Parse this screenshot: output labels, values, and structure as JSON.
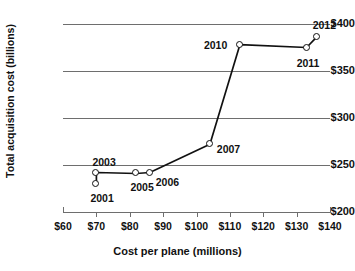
{
  "faint_header": {
    "text": ""
  },
  "chart_data": {
    "type": "line",
    "title": "",
    "xlabel": "Cost per plane (millions)",
    "ylabel": "Total acquisition cost (billions)",
    "xlim": [
      60,
      140
    ],
    "ylim": [
      200,
      400
    ],
    "grid": true,
    "legend": "none",
    "x_ticks": [
      "$60",
      "$70",
      "$80",
      "$90",
      "$100",
      "$110",
      "$120",
      "$130",
      "$140"
    ],
    "x_tick_values": [
      60,
      70,
      80,
      90,
      100,
      110,
      120,
      130,
      140
    ],
    "y_ticks": [
      "$200",
      "$250",
      "$300",
      "$350",
      "$400"
    ],
    "y_tick_values": [
      200,
      250,
      300,
      350,
      400
    ],
    "series": [
      {
        "name": "F-35 program",
        "points": [
          {
            "label": "2001",
            "x": 70,
            "y": 230,
            "label_dx": -6,
            "label_dy": 14
          },
          {
            "label": "2003",
            "x": 70,
            "y": 242,
            "label_dx": -4,
            "label_dy": -11
          },
          {
            "label": "2005",
            "x": 82,
            "y": 241,
            "label_dx": -6,
            "label_dy": 14
          },
          {
            "label": "2006",
            "x": 86,
            "y": 242,
            "label_dx": 6,
            "label_dy": 9
          },
          {
            "label": "2007",
            "x": 104,
            "y": 272,
            "label_dx": 7,
            "label_dy": 5
          },
          {
            "label": "2010",
            "x": 113,
            "y": 378,
            "label_dx": -36,
            "label_dy": 0
          },
          {
            "label": "2011",
            "x": 133,
            "y": 375,
            "label_dx": -10,
            "label_dy": 15
          },
          {
            "label": "2012",
            "x": 136,
            "y": 386,
            "label_dx": -4,
            "label_dy": -12
          }
        ],
        "path_order": [
          "2001",
          "2003",
          "2005",
          "2006",
          "2007",
          "2010",
          "2011",
          "2012"
        ]
      }
    ]
  },
  "colors": {
    "line": "#111111",
    "grid": "#6e6e6e",
    "marker_fill": "#ffffff",
    "text": "#111111",
    "background": "#ffffff"
  }
}
